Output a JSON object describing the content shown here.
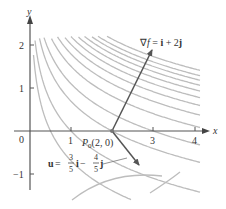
{
  "diagram": {
    "function_note": "level curves of f with gradient at P0",
    "axes": {
      "x_label": "x",
      "y_label": "y",
      "origin_label": "0",
      "x_ticks": [
        "1",
        "3",
        "4"
      ],
      "y_ticks": [
        "2",
        "1",
        "−1"
      ]
    },
    "point": {
      "label_prefix": "P",
      "label_sub": "0",
      "label_coords": "(2, 0)"
    },
    "gradient": {
      "label_nabla": "∇",
      "label_f": "f",
      "label_eq": " = ",
      "label_i": "i",
      "label_plus": " + 2",
      "label_j": "j"
    },
    "unit_vector": {
      "label_u": "u",
      "label_eq": " = ",
      "num1": "3",
      "den1": "5",
      "label_i": "i",
      "label_minus": " − ",
      "num2": "4",
      "den2": "5",
      "label_j": "j"
    },
    "colors": {
      "axis": "#555555",
      "curve": "#bdbdbd",
      "vector": "#555555",
      "text": "#333333"
    }
  }
}
